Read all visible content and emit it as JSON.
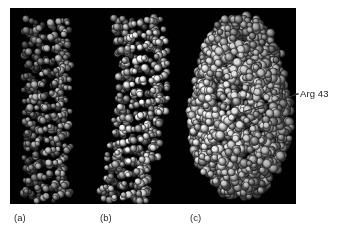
{
  "figure": {
    "name": "dna-protein-complex-space-filling-figure",
    "background_color": "#ffffff",
    "panel_color": "#010101",
    "panel": {
      "x": 10,
      "y": 8,
      "width": 286,
      "height": 196
    }
  },
  "annotations": [
    {
      "id": "arg43",
      "label": "Arg 43",
      "text_color": "#1a1a1a",
      "leader_from": {
        "x": 243,
        "y": 112
      },
      "leader_to": {
        "x": 298,
        "y": 94
      }
    }
  ],
  "captions": [
    {
      "id": "panel-a",
      "label": "(a)",
      "x": 14
    },
    {
      "id": "panel-b",
      "label": "(b)",
      "x": 100
    },
    {
      "id": "panel-c",
      "label": "(c)",
      "x": 190
    }
  ],
  "molecules": [
    {
      "id": "molecule-a",
      "caption": "(a)",
      "description": "straight DNA double helix, space-filling model",
      "center_x": 47,
      "top": 20,
      "bottom": 200,
      "half_width": 23,
      "curve_amplitude": 0,
      "atom_count": 520,
      "atom_radius": 3.2,
      "brightness": 0.82
    },
    {
      "id": "molecule-b",
      "caption": "(b)",
      "description": "bent DNA double helix, space-filling model",
      "center_x": 132,
      "top": 18,
      "bottom": 202,
      "half_width": 25,
      "curve_amplitude": 11,
      "atom_count": 600,
      "atom_radius": 3.3,
      "brightness": 0.88
    },
    {
      "id": "molecule-c",
      "caption": "(c)",
      "description": "DNA bound to protein, large globular space-filling complex",
      "center_x": 240,
      "top": 14,
      "bottom": 200,
      "half_width": 52,
      "curve_amplitude": 0,
      "atom_count": 1750,
      "atom_radius": 4.0,
      "brightness": 0.95
    }
  ],
  "colors": {
    "background": "#ffffff",
    "panel": "#010101",
    "atom_light": "#f2f2f2",
    "atom_mid": "#9a9a9a",
    "atom_dark": "#2a2a2a",
    "text": "#1a1a1a",
    "leader_line": "#3a3a3a"
  }
}
